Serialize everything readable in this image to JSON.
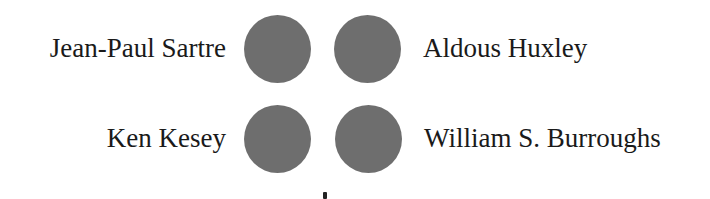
{
  "diagram": {
    "rows": [
      {
        "left_label": "Jean-Paul Sartre",
        "right_label": "Aldous Huxley"
      },
      {
        "left_label": "Ken Kesey",
        "right_label": "William S. Burroughs"
      }
    ],
    "dot_color": "#6e6e6e"
  }
}
